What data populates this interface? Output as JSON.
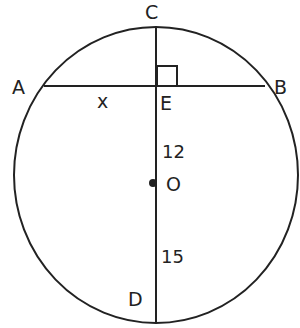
{
  "diagram": {
    "type": "circle-geometry",
    "points": {
      "A": "A",
      "B": "B",
      "C": "C",
      "D": "D",
      "E": "E",
      "O": "O"
    },
    "segment_labels": {
      "AE": "x",
      "CE_to_O": "12",
      "O_to_D": "15"
    },
    "relationships": [
      "Chord AB is perpendicular to diameter CD at E",
      "O is the center of the circle"
    ],
    "stroke_color": "#222222"
  }
}
